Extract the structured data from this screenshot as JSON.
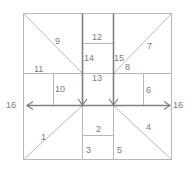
{
  "diagram": {
    "title": "",
    "colors": {
      "light_line": "#b8b8b8",
      "dark_line": "#7f7f7f",
      "label": "#7a7a7a"
    },
    "regions": [
      {
        "id": "1",
        "label": "1",
        "x": 41,
        "y": 140
      },
      {
        "id": "2",
        "label": "2",
        "x": 96,
        "y": 132
      },
      {
        "id": "3",
        "label": "3",
        "x": 86,
        "y": 153
      },
      {
        "id": "4",
        "label": "4",
        "x": 146,
        "y": 130
      },
      {
        "id": "5",
        "label": "5",
        "x": 117,
        "y": 153
      },
      {
        "id": "6",
        "label": "6",
        "x": 146,
        "y": 93
      },
      {
        "id": "7",
        "label": "7",
        "x": 147,
        "y": 49
      },
      {
        "id": "8",
        "label": "8",
        "x": 125,
        "y": 70
      },
      {
        "id": "9",
        "label": "9",
        "x": 55,
        "y": 44
      },
      {
        "id": "10",
        "label": "10",
        "x": 55,
        "y": 92
      },
      {
        "id": "11",
        "label": "11",
        "x": 34,
        "y": 72
      },
      {
        "id": "12",
        "label": "12",
        "x": 92,
        "y": 40
      },
      {
        "id": "13",
        "label": "13",
        "x": 92,
        "y": 80
      },
      {
        "id": "14",
        "label": "14",
        "x": 83,
        "y": 60
      },
      {
        "id": "15",
        "label": "15",
        "x": 115,
        "y": 60
      },
      {
        "id": "16-left",
        "label": "16",
        "x": 6,
        "y": 108
      },
      {
        "id": "16-right",
        "label": "16",
        "x": 173,
        "y": 108
      }
    ]
  }
}
